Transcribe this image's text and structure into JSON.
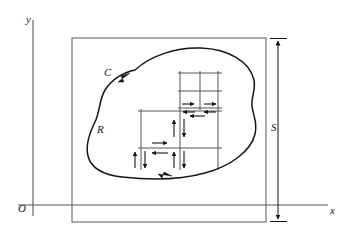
{
  "figure": {
    "background_color": "#ffffff",
    "stroke_color": "#141414",
    "grid_stroke_color": "#555555",
    "width": 345,
    "height": 238
  },
  "labels": {
    "y_axis": "y",
    "x_axis": "x",
    "origin": "O",
    "curve": "C",
    "region": "R",
    "square_side": "S"
  },
  "axes": {
    "y_axis_x": 33,
    "y_axis_top": 20,
    "y_axis_bottom": 216,
    "x_axis_y": 205,
    "x_axis_left": 18,
    "x_axis_right": 328
  },
  "bounding_square": {
    "left": 72,
    "top": 38,
    "right": 266,
    "bottom": 222,
    "label": "S"
  },
  "dimension_arrow": {
    "x": 278,
    "top": 38,
    "bottom": 222,
    "label": "S"
  },
  "curve": {
    "name": "C",
    "orientation": "counterclockwise",
    "arrow_positions": [
      {
        "x": 122,
        "y": 80,
        "direction": "down-left"
      },
      {
        "x": 165,
        "y": 176,
        "direction": "right"
      }
    ],
    "path": "M 135 70 C 150 56, 175 48, 200 48 C 228 48, 250 62, 254 80 C 256 90, 252 97, 253 106 C 254 116, 258 122, 255 134 C 251 150, 232 166, 205 173 C 180 179, 150 180, 122 177 C 104 175, 92 168, 88 156 C 84 144, 90 132, 95 122 C 100 112, 100 100, 106 90 C 113 79, 124 72, 135 70 Z"
  },
  "grid": {
    "upper_block": {
      "left": 180,
      "right": 218,
      "top": 73,
      "bottom": 108,
      "mid_x": 200,
      "mid_y": 91
    },
    "lower_block": {
      "left": 141,
      "right": 218,
      "top": 111,
      "bottom": 148,
      "mid_x": 180
    },
    "vertical_extents": [
      {
        "x": 141,
        "top": 111,
        "bottom": 168
      },
      {
        "x": 180,
        "top": 73,
        "bottom": 168
      },
      {
        "x": 200,
        "top": 73,
        "bottom": 108
      },
      {
        "x": 218,
        "top": 73,
        "bottom": 168
      }
    ],
    "horizontal_extents": [
      {
        "y": 73,
        "left": 178,
        "right": 222
      },
      {
        "y": 91,
        "left": 178,
        "right": 222
      },
      {
        "y": 108,
        "left": 178,
        "right": 222
      },
      {
        "y": 111,
        "left": 138,
        "right": 222
      },
      {
        "y": 148,
        "left": 138,
        "right": 222
      }
    ]
  },
  "cancellation_arrows": {
    "horizontal_pairs": [
      {
        "x": 188,
        "y": 104,
        "span": 12
      },
      {
        "x": 210,
        "y": 104,
        "span": 12
      },
      {
        "x": 199,
        "y": 114,
        "span": 12
      },
      {
        "x": 161,
        "y": 144,
        "span": 12
      },
      {
        "x": 161,
        "y": 153,
        "span": 12
      }
    ],
    "vertical_pairs": [
      {
        "x": 176,
        "y": 128,
        "span": 14
      },
      {
        "x": 176,
        "y": 158,
        "span": 14
      },
      {
        "x": 137,
        "y": 158,
        "span": 14
      }
    ]
  }
}
